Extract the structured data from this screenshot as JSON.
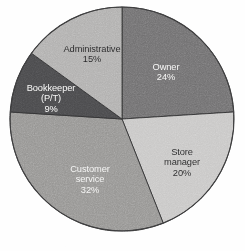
{
  "chart_data": {
    "type": "pie",
    "title": "",
    "subtitle": "",
    "xlabel": "",
    "ylabel": "",
    "legend": "none",
    "grid": false,
    "start_angle_deg": 0,
    "direction": "clockwise",
    "units": "percent",
    "total": 100,
    "categories": [
      "Owner",
      "Store manager",
      "Customer service",
      "Bookkeeper (P/T)",
      "Administrative"
    ],
    "values": [
      24,
      20,
      32,
      9,
      15
    ],
    "slices": [
      {
        "id": "owner",
        "label_lines": [
          "Owner"
        ],
        "value": 24,
        "value_label": "24%",
        "color": "#706f70",
        "text_color": "#f4f4f3",
        "label_x": 166,
        "label_y": 62
      },
      {
        "id": "store-manager",
        "label_lines": [
          "Store",
          "manager"
        ],
        "value": 20,
        "value_label": "20%",
        "color": "#c8c7c6",
        "text_color": "#262627",
        "label_x": 182,
        "label_y": 147
      },
      {
        "id": "customer-service",
        "label_lines": [
          "Customer",
          "service"
        ],
        "value": 32,
        "value_label": "32%",
        "color": "#959492",
        "text_color": "#f4f4f3",
        "label_x": 90,
        "label_y": 164
      },
      {
        "id": "bookkeeper",
        "label_lines": [
          "Bookkeeper",
          "(P/T)"
        ],
        "value": 9,
        "value_label": "9%",
        "color": "#4a4a4c",
        "text_color": "#f4f4f3",
        "label_x": 51,
        "label_y": 83
      },
      {
        "id": "administrative",
        "label_lines": [
          "Administrative"
        ],
        "value": 15,
        "value_label": "15%",
        "color": "#b0afae",
        "text_color": "#262627",
        "label_x": 92,
        "label_y": 44
      }
    ],
    "geometry": {
      "center_x": 122,
      "center_y": 119,
      "radius": 112
    },
    "background_color": "#fefefe",
    "outline_color": "#3a3a3b"
  }
}
